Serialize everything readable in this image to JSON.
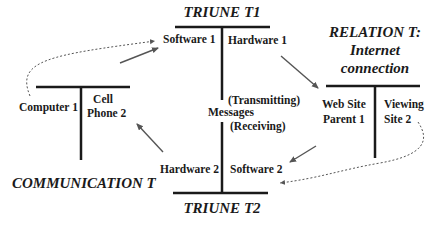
{
  "diagram": {
    "titles": {
      "triune_t1": "TRIUNE T1",
      "triune_t2": "TRIUNE T2",
      "communication_t": "COMMUNICATION T",
      "relation_t_line1": "RELATION T:",
      "relation_t_line2": "Internet",
      "relation_t_line3": "connection"
    },
    "triune_t1": {
      "left": "Software 1",
      "right": "Hardware 1"
    },
    "triune_t2": {
      "left": "Hardware 2",
      "right": "Software 2"
    },
    "center": {
      "transmitting": "(Transmitting)",
      "messages": "Messages",
      "receiving": "(Receiving)"
    },
    "communication_t": {
      "left": "Computer 1",
      "right_line1": "Cell",
      "right_line2": "Phone 2"
    },
    "relation_t": {
      "left_line1": "Web Site",
      "left_line2": "Parent 1",
      "right_line1": "Viewing",
      "right_line2": "Site 2"
    },
    "colors": {
      "line": "#1a1a1a",
      "arrow": "#555555",
      "background": "#ffffff"
    }
  }
}
